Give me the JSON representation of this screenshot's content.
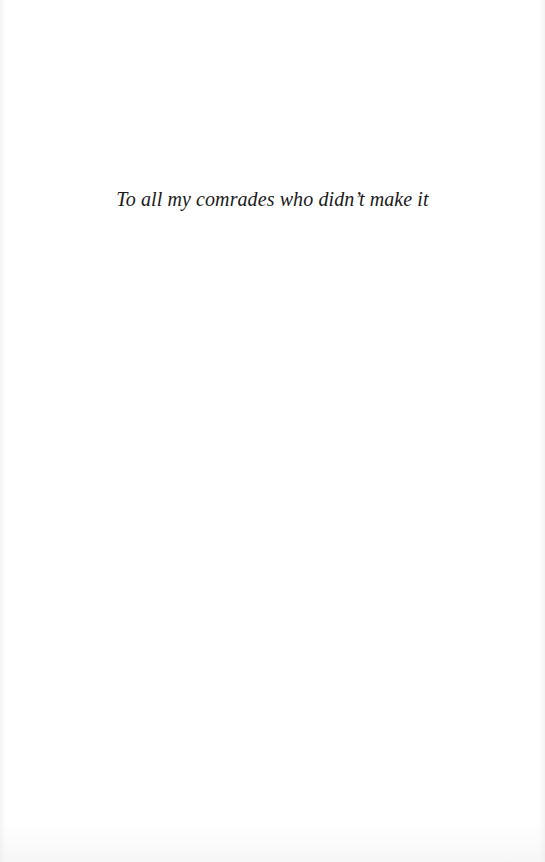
{
  "page": {
    "dedication": "To all my comrades who didn’t make it"
  }
}
